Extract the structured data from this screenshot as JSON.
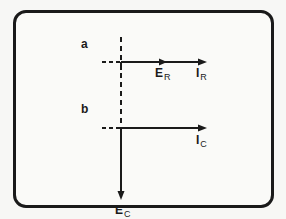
{
  "diagram": {
    "type": "phasor-diagram",
    "panels": [
      {
        "label": "a",
        "phasors": [
          {
            "name": "E",
            "subscript": "R",
            "direction": "right",
            "relative_length": 0.5
          },
          {
            "name": "I",
            "subscript": "R",
            "direction": "right",
            "relative_length": 1.0
          }
        ]
      },
      {
        "label": "b",
        "phasors": [
          {
            "name": "I",
            "subscript": "C",
            "direction": "right",
            "relative_length": 1.0
          },
          {
            "name": "E",
            "subscript": "C",
            "direction": "down",
            "relative_length": 0.9
          }
        ]
      }
    ],
    "colors": {
      "line": "#1a1a1a",
      "background": "#fafaf8"
    }
  }
}
